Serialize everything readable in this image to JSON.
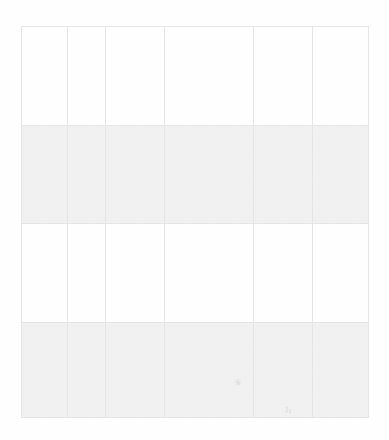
{
  "document": {
    "type": "scanned-table",
    "title": "",
    "background_color": "#ffffff",
    "page_width": 389,
    "page_height": 440
  },
  "table": {
    "name": "blank-grid-table",
    "border_color": "#e6e6e6",
    "shaded_row_color": "#f1f1f1",
    "plain_row_color": "#ffffff",
    "column_count": 6,
    "row_count": 4,
    "bounds": {
      "left": 21,
      "top": 26,
      "width": 347,
      "height": 391
    },
    "column_x_boundaries": [
      21,
      67,
      105,
      164,
      253,
      312,
      368
    ],
    "row_y_boundaries": [
      26,
      125,
      223,
      322,
      417
    ],
    "columns": [
      {
        "key": "c1",
        "header": "",
        "width_px": 46
      },
      {
        "key": "c2",
        "header": "",
        "width_px": 38
      },
      {
        "key": "c3",
        "header": "",
        "width_px": 59
      },
      {
        "key": "c4",
        "header": "",
        "width_px": 89
      },
      {
        "key": "c5",
        "header": "",
        "width_px": 59
      },
      {
        "key": "c6",
        "header": "",
        "width_px": 56
      }
    ],
    "rows": [
      {
        "shaded": false,
        "height_px": 99,
        "cells": [
          "",
          "",
          "",
          "",
          "",
          ""
        ]
      },
      {
        "shaded": true,
        "height_px": 98,
        "cells": [
          "",
          "",
          "",
          "",
          "",
          ""
        ]
      },
      {
        "shaded": false,
        "height_px": 99,
        "cells": [
          "",
          "",
          "",
          "",
          "",
          ""
        ]
      },
      {
        "shaded": true,
        "height_px": 95,
        "cells": [
          "",
          "",
          "",
          "",
          "",
          ""
        ]
      }
    ]
  },
  "artifacts": {
    "smudges": [
      {
        "name": "smudge-mark-a",
        "glyph": "✳",
        "x": 234,
        "y": 378
      },
      {
        "name": "smudge-mark-b",
        "glyph": "ʇ",
        "x": 285,
        "y": 404
      }
    ]
  }
}
